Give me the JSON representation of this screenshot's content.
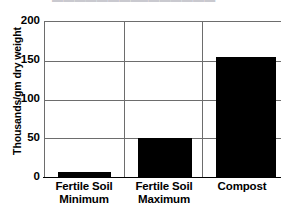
{
  "chart_data": {
    "type": "bar",
    "title": "",
    "subtitle": "",
    "xlabel": "",
    "ylabel": "Thousands/gm dry weight",
    "categories": [
      "Fertile Soil Minimum",
      "Fertile Soil Maximum",
      "Compost"
    ],
    "category_lines": [
      [
        "Fertile Soil",
        "Minimum"
      ],
      [
        "Fertile Soil",
        "Maximum"
      ],
      [
        "Compost",
        ""
      ]
    ],
    "values": [
      6,
      50,
      155
    ],
    "ylim": [
      0,
      200
    ],
    "yticks": [
      0,
      50,
      100,
      150,
      200
    ],
    "ytick_labels": [
      "0",
      "50",
      "100",
      "150",
      "200"
    ],
    "grid": "horizontal-and-category-dividers",
    "legend": "none",
    "bar_color": "#000000",
    "grid_color": "#6d6d6d",
    "axis_color": "#000000",
    "background_color": "#ffffff"
  },
  "clipped_header": {
    "ghost_left": "▬▬▬▬▬▬▬▬",
    "ghost_right": "▬▬▬▬▬▬▬"
  }
}
